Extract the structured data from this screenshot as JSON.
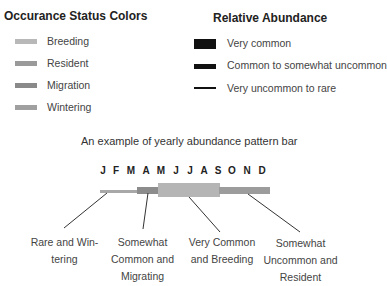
{
  "occurrence": {
    "title": "Occurance Status Colors",
    "items": [
      {
        "label": "Breeding",
        "color": "#b8b8b8"
      },
      {
        "label": "Resident",
        "color": "#9a9a9a"
      },
      {
        "label": "Migration",
        "color": "#8a8a8a"
      },
      {
        "label": "Wintering",
        "color": "#a0a0a0"
      }
    ]
  },
  "abundance": {
    "title": "Relative Abundance",
    "items": [
      {
        "label": "Very common",
        "thickness": 10
      },
      {
        "label": "Common to somewhat uncommon",
        "thickness": 5
      },
      {
        "label": "Very uncommon to rare",
        "thickness": 2
      }
    ]
  },
  "example": {
    "title": "An example of yearly abundance pattern bar",
    "months": [
      "J",
      "F",
      "M",
      "A",
      "M",
      "J",
      "J",
      "A",
      "S",
      "O",
      "N",
      "D"
    ],
    "segments": [
      {
        "status": "Wintering",
        "abundance": "Very uncommon to rare",
        "color": "#a8a8a8"
      },
      {
        "status": "Migration",
        "abundance": "Common to somewhat uncommon",
        "color": "#8c8c8c"
      },
      {
        "status": "Breeding",
        "abundance": "Very common",
        "color": "#b5b5b5"
      },
      {
        "status": "Resident",
        "abundance": "Common to somewhat uncommon",
        "color": "#9c9c9c"
      }
    ],
    "callouts": [
      {
        "line1": "Rare and Win-",
        "line2": "tering",
        "line3": ""
      },
      {
        "line1": "Somewhat",
        "line2": "Common and",
        "line3": "Migrating"
      },
      {
        "line1": "Very Common",
        "line2": "and Breeding",
        "line3": ""
      },
      {
        "line1": "Somewhat",
        "line2": "Uncommon and",
        "line3": "Resident"
      }
    ]
  }
}
